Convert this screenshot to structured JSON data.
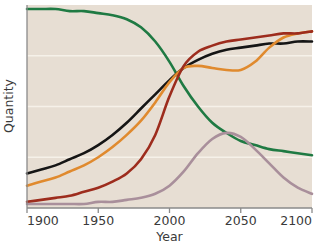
{
  "chart_data": {
    "type": "line",
    "title": "",
    "xlabel": "Year",
    "ylabel": "Quantity",
    "xlim": [
      1900,
      2100
    ],
    "ylim": [
      0,
      100
    ],
    "grid": true,
    "gridlines_y": [
      25,
      50,
      75
    ],
    "legend": "none",
    "xticks": [
      "1900",
      "1950",
      "2000",
      "2050",
      "2100"
    ],
    "xtick_values": [
      1900,
      1950,
      2000,
      2050,
      2100
    ],
    "yticks": [],
    "background_color": "#e7ded3",
    "axis_color": "#8a8a8a",
    "gridline_color": "#f6f1e9",
    "x": [
      1900,
      1910,
      1920,
      1930,
      1940,
      1950,
      1960,
      1970,
      1980,
      1990,
      2000,
      2010,
      2020,
      2030,
      2040,
      2050,
      2060,
      2070,
      2080,
      2090,
      2100
    ],
    "series": [
      {
        "name": "green-series",
        "color": "#1f7a43",
        "values": [
          98,
          98,
          98,
          97,
          97,
          96,
          95,
          93,
          89,
          82,
          72,
          60,
          50,
          42,
          37,
          33,
          31,
          29,
          28,
          27,
          26
        ]
      },
      {
        "name": "black-series",
        "color": "#151515",
        "values": [
          17,
          19,
          21,
          24,
          27,
          31,
          36,
          42,
          49,
          56,
          63,
          69,
          73,
          76,
          78,
          79,
          80,
          81,
          81,
          82,
          82
        ]
      },
      {
        "name": "orange-series",
        "color": "#e08a2e",
        "values": [
          11,
          13,
          15,
          18,
          21,
          25,
          30,
          36,
          43,
          52,
          62,
          69,
          70,
          69,
          68,
          68,
          72,
          79,
          84,
          86,
          87
        ]
      },
      {
        "name": "dark-red-series",
        "color": "#9d2c1d",
        "values": [
          3,
          4,
          5,
          6,
          8,
          10,
          13,
          17,
          24,
          36,
          55,
          70,
          77,
          80,
          82,
          83,
          84,
          85,
          86,
          86,
          87
        ]
      },
      {
        "name": "mauve-series",
        "color": "#a98f9b",
        "values": [
          2,
          2,
          2,
          2,
          2,
          3,
          3,
          4,
          5,
          7,
          11,
          18,
          27,
          34,
          37,
          35,
          29,
          22,
          15,
          10,
          7
        ]
      }
    ]
  },
  "axis": {
    "y_title": "Quantity",
    "x_title": "Year"
  }
}
